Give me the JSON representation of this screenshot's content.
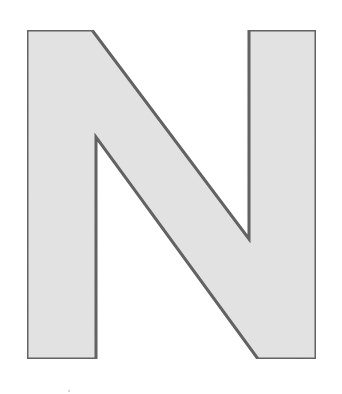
{
  "figure": {
    "letter": "N",
    "fill_color": "#e3e3e3",
    "stroke_color": "#5f5f5f",
    "stroke_width": 3,
    "points": "27,30 92,30 249,239 249,30 316,30 316,359 258,359 96,137 96,359 27,359"
  },
  "speck": {
    "x": 68,
    "y": 390
  }
}
